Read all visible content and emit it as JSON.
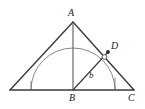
{
  "figure": {
    "type": "geometry-diagram",
    "background_color": "#ffffff",
    "stroke_color": "#3a3a3a",
    "arc_color": "#6e6e6e",
    "label_color": "#1a1a1a",
    "labels": {
      "apex": "A",
      "foot": "B",
      "right_base": "C",
      "point_on_hypotenuse": "D",
      "segment": "b"
    },
    "points": {
      "A": {
        "x": 73,
        "y": 22
      },
      "B": {
        "x": 73,
        "y": 90
      },
      "C": {
        "x": 134,
        "y": 90
      },
      "E": {
        "x": 10,
        "y": 90
      },
      "D": {
        "x": 108,
        "y": 52
      },
      "arc_left": {
        "x": 31,
        "y": 90
      },
      "arc_right": {
        "x": 115,
        "y": 90
      },
      "arc_top": {
        "x": 73,
        "y": 48
      }
    },
    "arc_radius": 42,
    "marker": {
      "x": 105,
      "y": 57,
      "r": 2.4
    },
    "tick_left": {
      "x": 31,
      "y_top": 81,
      "y_bottom": 90
    },
    "tick_right": {
      "x": 115,
      "y_top": 78,
      "y_bottom": 90
    }
  }
}
